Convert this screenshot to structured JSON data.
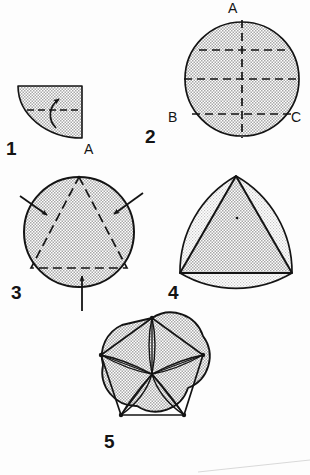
{
  "page": {
    "background_color": "#fdfdfd",
    "ink_color": "#141414",
    "fill_color": "#c9c9c9",
    "width": 310,
    "height": 475
  },
  "steps": [
    {
      "number": "1",
      "shape": "quarter-circle-wedge",
      "description": "Quarter circle wedge, flat top and right edges, curved lower-left arc, horizontal dashed fold line and curved arrow folding upward",
      "labels": [
        {
          "text": "A",
          "position": "bottom-right corner"
        }
      ],
      "arrows": [
        {
          "type": "curved",
          "direction": "up",
          "count": 1
        }
      ],
      "dashed_lines": 1
    },
    {
      "number": "2",
      "shape": "circle",
      "description": "Shaded circle with vertical dashed centre line through A, horizontal dashed centre line, an upper horizontal dashed chord and a lower horizontal dashed chord from B to C",
      "labels": [
        {
          "text": "A",
          "position": "top"
        },
        {
          "text": "B",
          "position": "lower-left"
        },
        {
          "text": "C",
          "position": "lower-right"
        }
      ],
      "arrows": [],
      "dashed_lines": 4
    },
    {
      "number": "3",
      "shape": "circle",
      "description": "Shaded circle with an inscribed dashed equilateral triangle, apex at top, and three arrows pointing inward at each side",
      "labels": [],
      "arrows": [
        {
          "type": "straight",
          "direction": "down-right",
          "position": "upper-left"
        },
        {
          "type": "straight",
          "direction": "down-left",
          "position": "upper-right"
        },
        {
          "type": "straight",
          "direction": "up",
          "position": "bottom"
        }
      ],
      "dashed_lines": 3
    },
    {
      "number": "4",
      "shape": "reuleaux-triangle",
      "description": "Rounded triangle (Reuleaux) outline with a solid inscribed triangle, apex at top, small centre dot",
      "labels": [],
      "arrows": [],
      "dashed_lines": 0
    },
    {
      "number": "5",
      "shape": "five-lobed-rosette",
      "description": "Five-lobed flower outline with inscribed pentagon and five narrow lens-shaped petals radiating from the centre to each vertex",
      "labels": [],
      "arrows": [],
      "dashed_lines": 0
    }
  ],
  "labels": {
    "step_1": "1",
    "step_2": "2",
    "step_3": "3",
    "step_4": "4",
    "step_5": "5",
    "a_fig1": "A",
    "a_fig2": "A",
    "b_fig2": "B",
    "c_fig2": "C"
  }
}
